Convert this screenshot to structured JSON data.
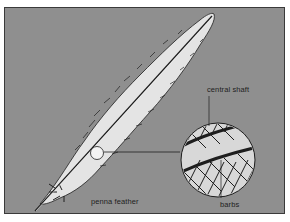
{
  "diagram": {
    "labels": {
      "central_shaft": "central shaft",
      "barbs": "barbs",
      "penna_feather": "penna  feather"
    },
    "colors": {
      "background": "#8f8f8f",
      "feather_fill": "#e4e4e4",
      "ink": "#1e1e1e",
      "border": "#3a3a3a"
    }
  }
}
